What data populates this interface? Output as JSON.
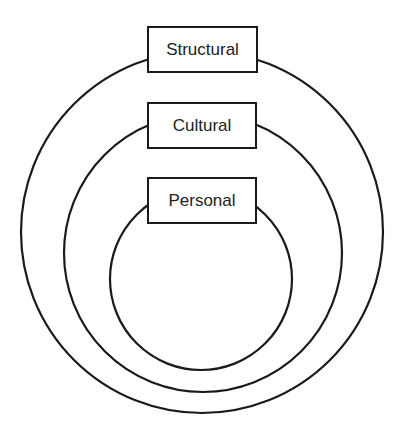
{
  "diagram": {
    "type": "concentric-circles",
    "colors": {
      "stroke": "#1a1a1a",
      "background": "#ffffff",
      "text": "#222222"
    },
    "layers": [
      {
        "id": "structural",
        "label": "Structural",
        "level": "outer"
      },
      {
        "id": "cultural",
        "label": "Cultural",
        "level": "middle"
      },
      {
        "id": "personal",
        "label": "Personal",
        "level": "inner"
      }
    ]
  }
}
